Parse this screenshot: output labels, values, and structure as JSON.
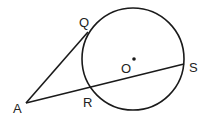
{
  "diagram": {
    "type": "geometry",
    "colors": {
      "stroke": "#1a1a1a",
      "background": "#ffffff",
      "label": "#222222"
    },
    "circle": {
      "center_label": "O",
      "cx": 133,
      "cy": 59,
      "r": 51
    },
    "points": {
      "A": {
        "label": "A",
        "x": 26,
        "y": 103
      },
      "Q": {
        "label": "Q",
        "x": 88,
        "y": 32
      },
      "R": {
        "label": "R",
        "x": 88,
        "y": 88
      },
      "S": {
        "label": "S",
        "x": 184,
        "y": 64
      },
      "O": {
        "label": "O",
        "x": 133,
        "y": 59
      }
    },
    "segments": [
      {
        "from": "A",
        "to": "Q",
        "kind": "tangent"
      },
      {
        "from": "A",
        "to": "S",
        "kind": "secant",
        "through": "R"
      }
    ]
  }
}
